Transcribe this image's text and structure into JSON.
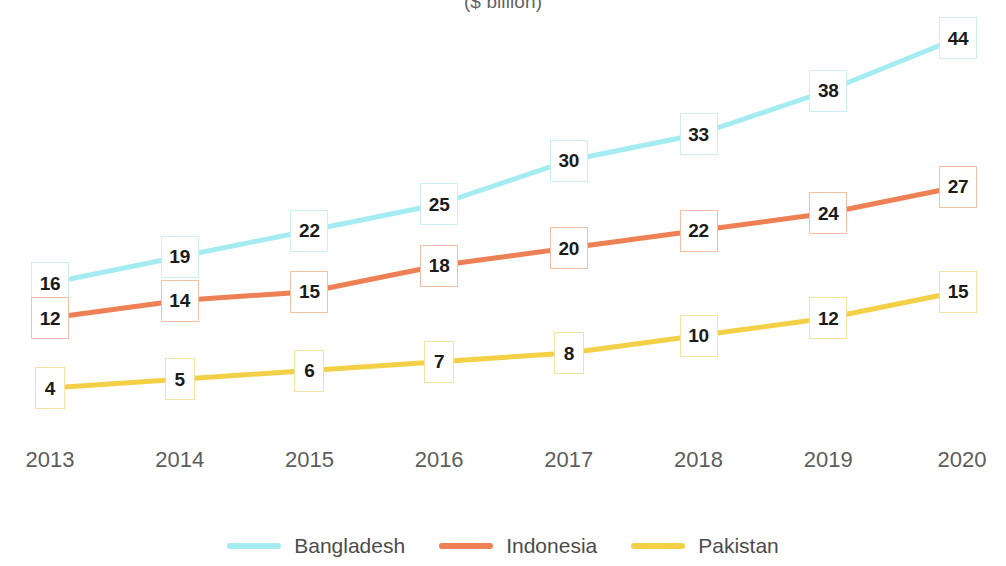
{
  "chart_data": {
    "type": "line",
    "title": "($ billion)",
    "xlabel": "",
    "ylabel": "",
    "grid": false,
    "legend_position": "bottom",
    "categories": [
      "2013",
      "2014",
      "2015",
      "2016",
      "2017",
      "2018",
      "2019",
      "2020"
    ],
    "x": [
      2013,
      2014,
      2015,
      2016,
      2017,
      2018,
      2019,
      2020
    ],
    "ylim": [
      0,
      46
    ],
    "series": [
      {
        "name": "Bangladesh",
        "color": "#a5ecf2",
        "values": [
          16,
          19,
          22,
          25,
          30,
          33,
          38,
          44
        ]
      },
      {
        "name": "Indonesia",
        "color": "#ee8055",
        "values": [
          12,
          14,
          15,
          18,
          20,
          22,
          24,
          27
        ]
      },
      {
        "name": "Pakistan",
        "color": "#f4d047",
        "values": [
          4,
          5,
          6,
          7,
          8,
          10,
          12,
          15
        ]
      }
    ]
  },
  "axis": {
    "x_ticks": [
      "2013",
      "2014",
      "2015",
      "2016",
      "2017",
      "2018",
      "2019",
      "2020"
    ],
    "tick_color": "#5d5d5d"
  },
  "legend": {
    "items": [
      {
        "label": "Bangladesh",
        "color": "#a5ecf2"
      },
      {
        "label": "Indonesia",
        "color": "#ee8055"
      },
      {
        "label": "Pakistan",
        "color": "#f4d047"
      }
    ]
  },
  "labels": {
    "bangladesh": [
      "16",
      "19",
      "22",
      "25",
      "30",
      "33",
      "38",
      "44"
    ],
    "indonesia": [
      "12",
      "14",
      "15",
      "18",
      "20",
      "22",
      "24",
      "27"
    ],
    "pakistan": [
      "4",
      "5",
      "6",
      "7",
      "8",
      "10",
      "12",
      "15"
    ]
  },
  "colors": {
    "bangladesh": "#a5ecf2",
    "indonesia": "#ee8055",
    "pakistan": "#f4d047",
    "label_border_bangladesh": "#cdeef2",
    "label_border_indonesia": "#f3c0a6",
    "label_border_pakistan": "#f6e3a1",
    "label_text": "#1b1b1b",
    "background": "#ffffff"
  }
}
